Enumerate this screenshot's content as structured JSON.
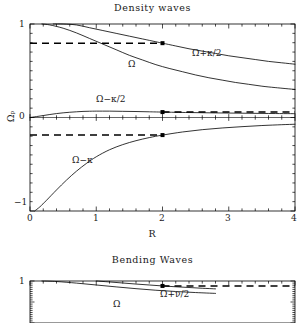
{
  "figure": {
    "background": "#ffffff",
    "line_color": "#000000",
    "panels": [
      {
        "id": "density-waves",
        "title": "Density waves",
        "frame": {
          "left": 30,
          "top": 24,
          "right": 295,
          "bottom": 211
        },
        "xlabel": "R",
        "ylabel": "Ωₚ",
        "xticks": [
          "0",
          "1",
          "2",
          "3",
          "4"
        ],
        "yticks": [
          "1",
          "0",
          "−1"
        ],
        "xlim": [
          0,
          4
        ],
        "ylim": [
          -1,
          1
        ]
      },
      {
        "id": "bending-waves",
        "title": "Bending Waves",
        "frame": {
          "left": 30,
          "top": 281,
          "right": 295,
          "bottom": 323
        },
        "xlabel": "",
        "ylabel": "",
        "xticks": [],
        "yticks": [
          "1"
        ],
        "xlim": [
          0,
          4
        ],
        "ylim": [
          -1,
          1
        ]
      }
    ]
  },
  "chart_data": [
    {
      "type": "line",
      "id": "density-waves",
      "title": "Density waves",
      "xlabel": "R",
      "ylabel": "Ωₚ",
      "xlim": [
        0,
        4
      ],
      "ylim": [
        -1,
        1
      ],
      "grid": false,
      "legend_position": "inline-annotations",
      "xticks": [
        0,
        1,
        2,
        3,
        4
      ],
      "yticks": [
        1,
        0,
        -1
      ],
      "minor_ticks": true,
      "series": [
        {
          "name": "Ω+κ/2",
          "label": "Ω+κ/2",
          "label_xy": [
            2.45,
            0.7
          ],
          "style": "solid",
          "x": [
            0.35,
            0.5,
            0.7,
            0.9,
            1.1,
            1.3,
            1.5,
            1.7,
            1.9,
            2.0,
            2.2,
            2.4,
            2.6,
            2.8,
            3.0,
            3.2,
            3.4,
            3.6,
            3.8,
            4.0
          ],
          "y": [
            1.0,
            1.0,
            0.99,
            0.96,
            0.93,
            0.9,
            0.87,
            0.84,
            0.81,
            0.795,
            0.765,
            0.735,
            0.71,
            0.685,
            0.66,
            0.64,
            0.62,
            0.6,
            0.585,
            0.57
          ]
        },
        {
          "name": "Ω",
          "label": "Ω",
          "label_xy": [
            1.52,
            0.66
          ],
          "style": "solid",
          "x": [
            0.18,
            0.3,
            0.5,
            0.7,
            0.9,
            1.1,
            1.3,
            1.5,
            1.7,
            1.9,
            2.1,
            2.3,
            2.5,
            2.7,
            2.9,
            3.1,
            3.3,
            3.5,
            3.7,
            4.0
          ],
          "y": [
            1.0,
            0.99,
            0.955,
            0.905,
            0.845,
            0.785,
            0.725,
            0.665,
            0.615,
            0.565,
            0.525,
            0.49,
            0.455,
            0.425,
            0.4,
            0.375,
            0.355,
            0.335,
            0.32,
            0.3
          ]
        },
        {
          "name": "Ω−κ/2",
          "label": "Ω−κ/2",
          "label_xy": [
            1.12,
            0.135
          ],
          "style": "solid",
          "x": [
            0.0,
            0.1,
            0.2,
            0.3,
            0.4,
            0.5,
            0.6,
            0.7,
            0.8,
            0.9,
            1.0,
            1.2,
            1.4,
            1.6,
            1.8,
            2.0,
            2.4,
            2.8,
            3.2,
            3.6,
            4.0
          ],
          "y": [
            0.0,
            0.01,
            0.021,
            0.032,
            0.042,
            0.05,
            0.056,
            0.061,
            0.065,
            0.067,
            0.068,
            0.068,
            0.066,
            0.064,
            0.061,
            0.058,
            0.053,
            0.049,
            0.046,
            0.043,
            0.041
          ]
        },
        {
          "name": "Ω−κ",
          "label": "Ω−κ",
          "label_xy": [
            0.66,
            -0.4
          ],
          "style": "solid",
          "x": [
            0.07,
            0.15,
            0.25,
            0.4,
            0.55,
            0.7,
            0.85,
            1.0,
            1.2,
            1.4,
            1.6,
            1.8,
            2.0,
            2.3,
            2.6,
            2.9,
            3.2,
            3.5,
            3.8,
            4.0
          ],
          "y": [
            -1.0,
            -0.955,
            -0.885,
            -0.775,
            -0.67,
            -0.575,
            -0.492,
            -0.42,
            -0.345,
            -0.29,
            -0.248,
            -0.215,
            -0.188,
            -0.155,
            -0.13,
            -0.112,
            -0.098,
            -0.086,
            -0.077,
            -0.072
          ]
        }
      ],
      "annotation_markers": [
        {
          "x": 2.0,
          "y": 0.795,
          "series": "Ω+κ/2"
        },
        {
          "x": 2.0,
          "y": 0.058,
          "series": "Ω−κ/2"
        },
        {
          "x": 2.0,
          "y": -0.188,
          "series": "Ω−κ"
        }
      ],
      "dashed_guides": [
        {
          "y": 0.795,
          "x_from": 0.0,
          "x_to": 2.0
        },
        {
          "y": 0.058,
          "x_from": 2.0,
          "x_to": 4.0
        },
        {
          "y": -0.188,
          "x_from": 0.0,
          "x_to": 2.0
        }
      ]
    },
    {
      "type": "line",
      "id": "bending-waves",
      "title": "Bending Waves",
      "xlabel": "",
      "ylabel": "",
      "xlim": [
        0,
        4
      ],
      "ylim": [
        -1,
        1
      ],
      "grid": false,
      "legend_position": "inline-annotations",
      "xticks": [],
      "yticks": [
        1
      ],
      "minor_ticks": true,
      "series": [
        {
          "name": "Ω",
          "label": "Ω",
          "label_xy": [
            1.28,
            0.53
          ],
          "style": "solid",
          "x": [
            0.18,
            0.4,
            0.7,
            1.0,
            1.3,
            1.6,
            1.9,
            2.2,
            2.5,
            2.8
          ],
          "y": [
            1.0,
            0.975,
            0.9,
            0.81,
            0.72,
            0.635,
            0.56,
            0.5,
            0.45,
            0.41
          ]
        },
        {
          "name": "Ω+ν/2",
          "label": "Ω+ν/2",
          "label_xy": [
            2.07,
            0.79
          ],
          "style": "solid",
          "x": [
            1.0,
            1.2,
            1.4,
            1.6,
            1.8,
            2.0,
            2.2,
            2.4,
            2.6,
            2.8
          ],
          "y": [
            1.0,
            0.955,
            0.905,
            0.855,
            0.81,
            0.765,
            0.725,
            0.69,
            0.655,
            0.625
          ]
        }
      ],
      "annotation_markers": [
        {
          "x": 2.0,
          "y": 0.765,
          "series": "Ω+ν/2"
        }
      ],
      "dashed_guides": [
        {
          "y": 0.765,
          "x_from": 2.0,
          "x_to": 4.0
        }
      ]
    }
  ]
}
